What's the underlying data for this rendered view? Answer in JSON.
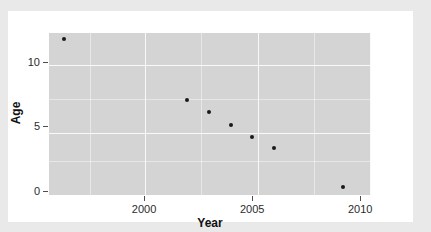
{
  "chart_data": {
    "type": "scatter",
    "title": "",
    "xlabel": "Year",
    "ylabel": "Age",
    "xlim": [
      1995.6,
      2010.5
    ],
    "ylim": [
      -0.3,
      12.2
    ],
    "xticks": [
      2000,
      2005,
      2010
    ],
    "xtick_labels": [
      "2000",
      "2005",
      "2010"
    ],
    "yticks": [
      0,
      5,
      10
    ],
    "ytick_labels": [
      "0",
      "5",
      "10"
    ],
    "grid": true,
    "legend": null,
    "point_color": "#1a1a1a",
    "panel_color": "#d4d4d4",
    "x": [
      1996.3,
      2002.0,
      2003.0,
      2004.0,
      2005.0,
      2006.0,
      2009.2
    ],
    "y": [
      11.7,
      7.0,
      6.1,
      5.1,
      4.2,
      3.3,
      0.3
    ],
    "points": [
      {
        "year": 1996.3,
        "age": 11.7
      },
      {
        "year": 2002.0,
        "age": 7.0
      },
      {
        "year": 2003.0,
        "age": 6.1
      },
      {
        "year": 2004.0,
        "age": 5.1
      },
      {
        "year": 2005.0,
        "age": 4.2
      },
      {
        "year": 2006.0,
        "age": 3.3
      },
      {
        "year": 2009.2,
        "age": 0.3
      }
    ]
  },
  "axes": {
    "x_axis_label": "Year",
    "y_axis_label": "Age",
    "x_tick_labels": [
      "2000",
      "2005",
      "2010"
    ],
    "y_tick_labels": [
      "0",
      "5",
      "10"
    ]
  }
}
